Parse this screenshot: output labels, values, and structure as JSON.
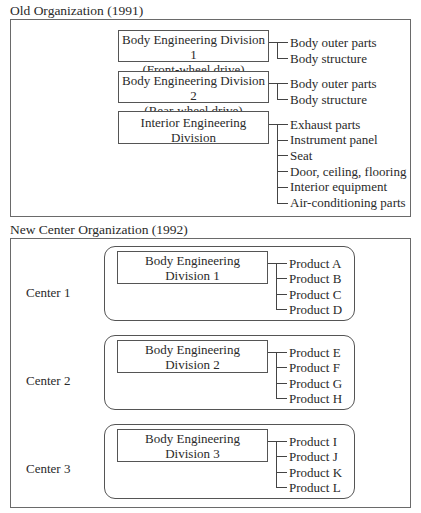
{
  "old_org": {
    "title": "Old Organization (1991)",
    "divisions": [
      {
        "line1": "Body Engineering Division 1",
        "line2": "(Front-wheel drive)",
        "items": [
          "Body outer parts",
          "Body structure"
        ]
      },
      {
        "line1": "Body Engineering Division 2",
        "line2": "(Rear-wheel drive)",
        "items": [
          "Body outer parts",
          "Body structure"
        ]
      },
      {
        "line1": "Interior Engineering",
        "line2": "Division",
        "items": [
          "Exhaust parts",
          "Instrument panel",
          "Seat",
          "Door, ceiling, flooring",
          "Interior equipment",
          "Air-conditioning parts"
        ]
      }
    ]
  },
  "new_org": {
    "title": "New Center Organization (1992)",
    "centers": [
      {
        "label": "Center 1",
        "line1": "Body Engineering",
        "line2": "Division 1",
        "items": [
          "Product A",
          "Product B",
          "Product C",
          "Product D"
        ]
      },
      {
        "label": "Center 2",
        "line1": "Body Engineering",
        "line2": "Division 2",
        "items": [
          "Product E",
          "Product F",
          "Product G",
          "Product H"
        ]
      },
      {
        "label": "Center 3",
        "line1": "Body Engineering",
        "line2": "Division 3",
        "items": [
          "Product I",
          "Product J",
          "Product K",
          "Product L"
        ]
      }
    ]
  }
}
